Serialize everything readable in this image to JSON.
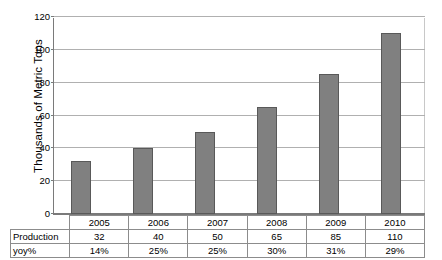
{
  "chart_data": {
    "type": "bar",
    "title": "",
    "xlabel": "",
    "ylabel": "Thousands of Metric Tons",
    "categories": [
      "2005",
      "2006",
      "2007",
      "2008",
      "2009",
      "2010"
    ],
    "values": [
      32,
      40,
      50,
      65,
      85,
      110
    ],
    "ylim": [
      0,
      120
    ],
    "ytick_values": [
      0,
      20,
      40,
      60,
      80,
      100,
      120
    ],
    "ytick_labels": [
      "0",
      "20",
      "40",
      "60",
      "80",
      "100",
      "120"
    ],
    "grid": true,
    "legend": "none",
    "bar_color": "#808080",
    "bar_edge_color": "#595959",
    "gridline_color": "#b0b0b0",
    "axis_color": "#7a7a7a",
    "series": [
      {
        "name": "Production",
        "values": [
          32,
          40,
          50,
          65,
          85,
          110
        ]
      },
      {
        "name": "yoy%",
        "values": [
          "14%",
          "25%",
          "25%",
          "30%",
          "31%",
          "29%"
        ]
      }
    ],
    "data_table": {
      "row_labels": [
        "Production",
        "yoy%"
      ],
      "header": [
        "2005",
        "2006",
        "2007",
        "2008",
        "2009",
        "2010"
      ],
      "rows": [
        [
          "32",
          "40",
          "50",
          "65",
          "85",
          "110"
        ],
        [
          "14%",
          "25%",
          "25%",
          "30%",
          "31%",
          "29%"
        ]
      ]
    }
  }
}
